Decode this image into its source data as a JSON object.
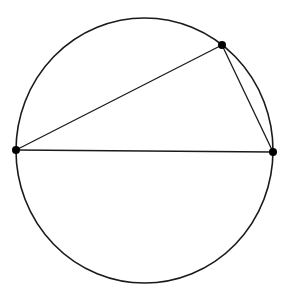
{
  "diagram": {
    "type": "inscribed-triangle",
    "background": "#ffffff",
    "stroke_color": "#1a1a1a",
    "circle": {
      "cx": 144.5,
      "cy": 150.5,
      "rx": 128.5,
      "ry": 132.5
    },
    "points": [
      {
        "name": "left-point",
        "x": 16,
        "y": 150
      },
      {
        "name": "right-point",
        "x": 273,
        "y": 152
      },
      {
        "name": "top-point",
        "x": 222,
        "y": 45
      }
    ],
    "segments": [
      {
        "name": "diameter-segment",
        "from": 0,
        "to": 1
      },
      {
        "name": "long-chord-segment",
        "from": 0,
        "to": 2
      },
      {
        "name": "short-chord-segment",
        "from": 2,
        "to": 1
      }
    ]
  }
}
